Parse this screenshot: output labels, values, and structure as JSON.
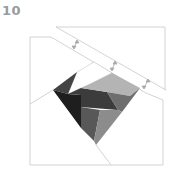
{
  "diagram": {
    "step_number": "10",
    "type": "origami-fold-step",
    "colors": {
      "line": "#c8c8c8",
      "arrow": "#a8a8a8",
      "darkest": "#1e1e1e",
      "dark": "#3c3c3c",
      "mid_dark": "#585858",
      "mid": "#6e6e6e",
      "mid_light": "#8c8c8c",
      "light": "#b4b4b4"
    },
    "fold_arrows": 3
  }
}
